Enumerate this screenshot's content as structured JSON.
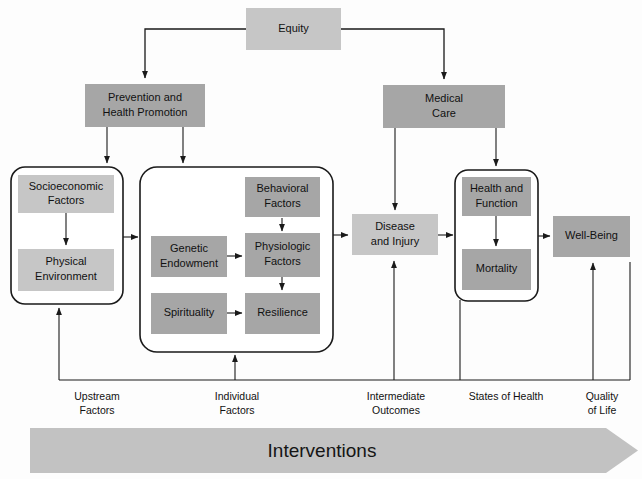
{
  "diagram": {
    "colors": {
      "light_box": "#c6c6c6",
      "dark_box": "#a6a6a6",
      "banner": "#c2c2c2",
      "line": "#1a1a1a",
      "background": "#ffffff"
    },
    "nodes": {
      "equity": {
        "label": "Equity",
        "shade": "light"
      },
      "prevention": {
        "line1": "Prevention and",
        "line2": "Health Promotion",
        "shade": "dark"
      },
      "medical_care": {
        "line1": "Medical",
        "line2": "Care",
        "shade": "dark"
      },
      "socioeconomic": {
        "line1": "Socioeconomic",
        "line2": "Factors",
        "shade": "light"
      },
      "physical_environment": {
        "line1": "Physical",
        "line2": "Environment",
        "shade": "light"
      },
      "behavioral": {
        "line1": "Behavioral",
        "line2": "Factors",
        "shade": "dark"
      },
      "genetic": {
        "line1": "Genetic",
        "line2": "Endowment",
        "shade": "dark"
      },
      "physiologic": {
        "line1": "Physiologic",
        "line2": "Factors",
        "shade": "dark"
      },
      "spirituality": {
        "line1": "Spirituality",
        "line2": "",
        "shade": "dark"
      },
      "resilience": {
        "line1": "Resilience",
        "line2": "",
        "shade": "dark"
      },
      "disease": {
        "line1": "Disease",
        "line2": "and Injury",
        "shade": "light"
      },
      "health_function": {
        "line1": "Health and",
        "line2": "Function",
        "shade": "dark"
      },
      "mortality": {
        "line1": "Mortality",
        "line2": "",
        "shade": "dark"
      },
      "wellbeing": {
        "line1": "Well-Being",
        "line2": "",
        "shade": "dark"
      }
    },
    "axis_labels": {
      "upstream": {
        "line1": "Upstream",
        "line2": "Factors"
      },
      "individual": {
        "line1": "Individual",
        "line2": "Factors"
      },
      "intermediate": {
        "line1": "Intermediate",
        "line2": "Outcomes"
      },
      "states": {
        "line1": "States of Health",
        "line2": ""
      },
      "quality": {
        "line1": "Quality",
        "line2": "of Life"
      }
    },
    "banner": {
      "label": "Interventions"
    }
  }
}
